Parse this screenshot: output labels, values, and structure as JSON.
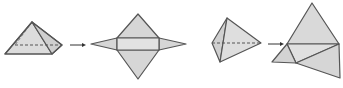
{
  "figure": {
    "colors": {
      "fill": "#d9d9d9",
      "fill_light": "#e4e4e4",
      "stroke": "#555555",
      "arrow": "#333333"
    },
    "items": [
      {
        "name": "square-pyramid",
        "label": ""
      },
      {
        "name": "square-pyramid-net",
        "label": ""
      },
      {
        "name": "triangular-pyramid",
        "label": ""
      },
      {
        "name": "triangular-pyramid-net",
        "label": ""
      }
    ],
    "arrows": [
      {
        "from": "square-pyramid",
        "to": "square-pyramid-net"
      },
      {
        "from": "triangular-pyramid",
        "to": "triangular-pyramid-net"
      }
    ]
  }
}
